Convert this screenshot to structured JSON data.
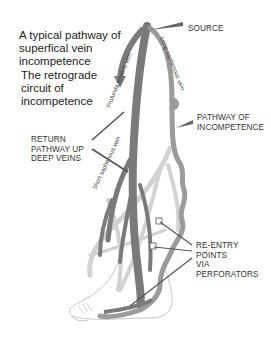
{
  "title": {
    "line1": "A typical pathway of",
    "line2": "superfical vein",
    "line3": "incompetence"
  },
  "subtitle": {
    "line1": "The retrograde",
    "line2": "circuit of",
    "line3": "incompetence"
  },
  "labels": {
    "source": "SOURCE",
    "pathway": {
      "line1": "PATHWAY OF",
      "line2": "INCOMPETENCE"
    },
    "return": {
      "line1": "RETURN",
      "line2": "PATHWAY UP",
      "line3": "DEEP VEINS"
    },
    "reentry": {
      "line1": "RE-ENTRY POINTS",
      "line2": "VIA",
      "line3": "PERFORATORS"
    }
  },
  "vein_labels": {
    "profunda": "Profunda femoris vein",
    "long_saphenous": "Long saphenous vein",
    "short_saphenous": "Short saphenous vein"
  },
  "colors": {
    "deep_vein": "#7a7a7a",
    "superficial_vein": "#9b9b9b",
    "light_vein": "#cfcfcf",
    "pointer": "#555555",
    "outline": "#bdbdbd"
  }
}
